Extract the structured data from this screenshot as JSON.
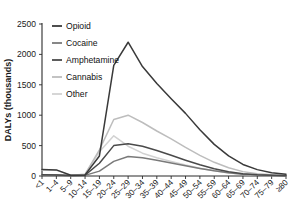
{
  "chart_data": {
    "type": "line",
    "title": "",
    "xlabel": "",
    "ylabel": "DALYs (thousands)",
    "ylim": [
      0,
      2500
    ],
    "yticks": [
      0,
      500,
      1000,
      1500,
      2000,
      2500
    ],
    "ytick_labels": [
      "0",
      "500",
      "1000",
      "1500",
      "2000",
      "2500"
    ],
    "grid": false,
    "legend_position": "top-left",
    "categories": [
      "<1",
      "1–4",
      "5–9",
      "10–14",
      "15–19",
      "20–24",
      "25–29",
      "30–34",
      "35–39",
      "40–44",
      "45–49",
      "50–54",
      "55–59",
      "60–64",
      "65–69",
      "70–74",
      "75–79",
      "≥80"
    ],
    "series": [
      {
        "name": "Opioid",
        "color": "#3a3a3a",
        "values": [
          105,
          100,
          12,
          18,
          330,
          1820,
          2200,
          1800,
          1520,
          1270,
          1030,
          760,
          520,
          330,
          190,
          105,
          55,
          30
        ]
      },
      {
        "name": "Cocaine",
        "color": "#7a7a7a",
        "values": [
          18,
          15,
          6,
          10,
          80,
          240,
          320,
          300,
          260,
          215,
          170,
          125,
          85,
          52,
          28,
          15,
          8,
          5
        ]
      },
      {
        "name": "Amphetamine",
        "color": "#4a4a4a",
        "values": [
          20,
          18,
          8,
          14,
          210,
          500,
          530,
          490,
          420,
          340,
          260,
          185,
          120,
          70,
          38,
          20,
          11,
          6
        ]
      },
      {
        "name": "Cannabis",
        "color": "#bdbdbd",
        "values": [
          22,
          20,
          10,
          28,
          430,
          930,
          1000,
          880,
          740,
          610,
          470,
          340,
          225,
          135,
          72,
          38,
          20,
          11
        ]
      },
      {
        "name": "Other",
        "color": "#d2d2d2",
        "values": [
          100,
          95,
          14,
          30,
          400,
          660,
          490,
          375,
          300,
          240,
          180,
          128,
          85,
          50,
          27,
          14,
          8,
          4
        ]
      }
    ]
  }
}
